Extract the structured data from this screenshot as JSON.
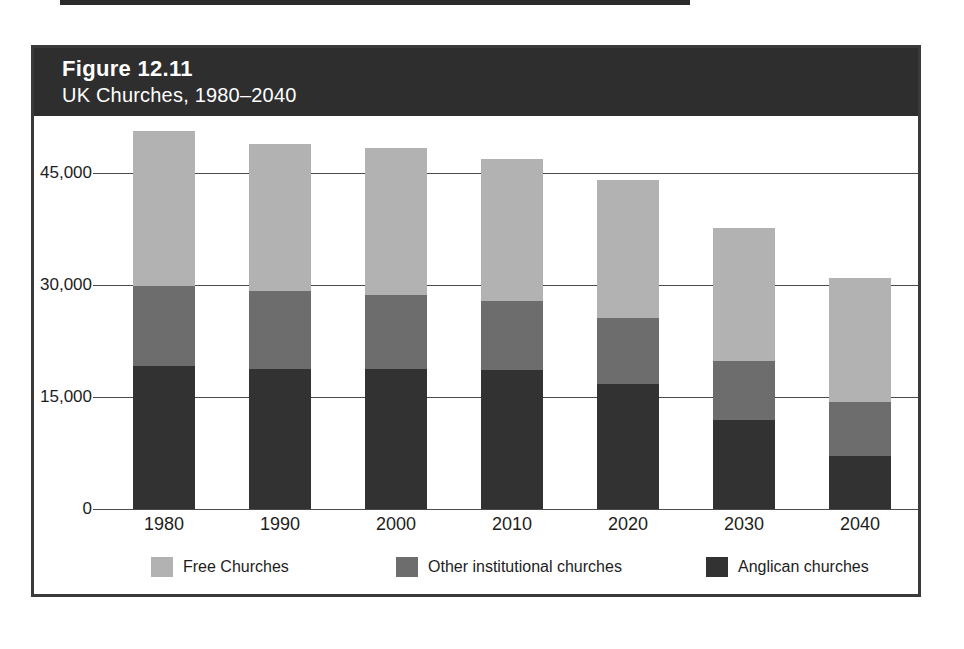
{
  "figure": {
    "number": "Figure 12.11",
    "caption": "UK Churches, 1980–2040"
  },
  "colors": {
    "header_band": "#2e2e2e",
    "frame": "#3a3a3a",
    "free_churches": "#b2b2b2",
    "other_institutional": "#6d6d6d",
    "anglican": "#323232",
    "gridline": "#4a4a4a",
    "text": "#1d1d1d",
    "background": "#ffffff"
  },
  "legend": {
    "position": "bottom",
    "items": [
      {
        "label": "Free Churches",
        "swatch": "#b2b2b2",
        "key": "free_churches"
      },
      {
        "label": "Other institutional churches",
        "swatch": "#6d6d6d",
        "key": "other_institutional"
      },
      {
        "label": "Anglican churches",
        "swatch": "#323232",
        "key": "anglican"
      }
    ]
  },
  "axes": {
    "y_ticks": [
      "0",
      "15,000",
      "30,000",
      "45,000"
    ],
    "y_tick_values": [
      0,
      15000,
      30000,
      45000
    ],
    "x_ticks": [
      "1980",
      "1990",
      "2000",
      "2010",
      "2020",
      "2030",
      "2040"
    ]
  },
  "chart_data": {
    "type": "bar",
    "subtype": "stacked-vertical",
    "title": "UK Churches, 1980–2040",
    "subtitle": "Figure 12.11",
    "xlabel": "",
    "ylabel": "",
    "ylim": [
      0,
      52500
    ],
    "grid": true,
    "legend_position": "bottom",
    "stacked": true,
    "categories": [
      "1980",
      "1990",
      "2000",
      "2010",
      "2020",
      "2030",
      "2040"
    ],
    "series": [
      {
        "name": "Anglican churches",
        "color": "#323232",
        "values": [
          19100,
          18800,
          18700,
          18600,
          16800,
          11900,
          7100
        ]
      },
      {
        "name": "Other institutional churches",
        "color": "#6d6d6d",
        "values": [
          10800,
          10400,
          10000,
          9300,
          8800,
          7900,
          7300
        ]
      },
      {
        "name": "Free Churches",
        "color": "#b2b2b2",
        "values": [
          20700,
          19700,
          19700,
          19000,
          18400,
          17900,
          16500
        ]
      }
    ],
    "totals": [
      50600,
      48900,
      48400,
      46900,
      44000,
      37700,
      30900
    ]
  }
}
